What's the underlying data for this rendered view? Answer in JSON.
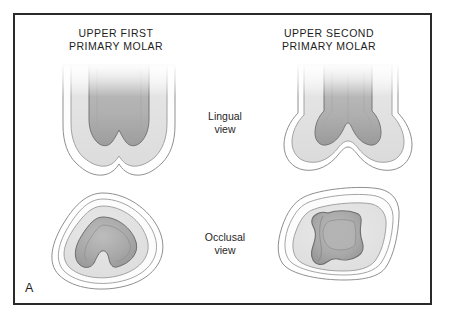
{
  "figure": {
    "panel_letter": "A",
    "border_color": "#2a2a2a",
    "background_color": "#ffffff"
  },
  "columns": [
    {
      "id": "upper-first",
      "title": "UPPER FIRST\nPRIMARY MOLAR"
    },
    {
      "id": "upper-second",
      "title": "UPPER SECOND\nPRIMARY MOLAR"
    }
  ],
  "rows": [
    {
      "id": "lingual",
      "label": "Lingual\nview"
    },
    {
      "id": "occlusal",
      "label": "Occlusal\nview"
    }
  ],
  "palette": {
    "enamel": "#ffffff",
    "enamel_outline": "#8f8f8f",
    "dentin": "#e3e3e3",
    "dentin_outline": "#9a9a9a",
    "pulp": "#b2b2b2",
    "pulp_outline": "#6e6e6e",
    "pulp_deep": "#9c9c9c",
    "text": "#1d1d1d"
  },
  "figures": [
    {
      "id": "first-lingual",
      "tooth": "upper first primary molar",
      "view": "lingual",
      "layers": [
        "enamel",
        "dentin",
        "pulp"
      ],
      "cusps": 2,
      "description": "narrow crown, tapering root trunk, two-lobed pulp chamber roof"
    },
    {
      "id": "second-lingual",
      "tooth": "upper second primary molar",
      "view": "lingual",
      "layers": [
        "enamel",
        "dentin",
        "pulp"
      ],
      "cusps": 2,
      "description": "broad rounded crown with deep central groove and prominent pulp horns"
    },
    {
      "id": "first-occlusal",
      "tooth": "upper first primary molar",
      "view": "occlusal",
      "layers": [
        "enamel",
        "dentin",
        "pulp"
      ],
      "outline_shape": "rounded triangular teardrop",
      "description": "concentric enamel, dentin and triangular pulp chamber"
    },
    {
      "id": "second-occlusal",
      "tooth": "upper second primary molar",
      "view": "occlusal",
      "layers": [
        "enamel",
        "dentin",
        "pulp"
      ],
      "outline_shape": "rounded rhomboid",
      "description": "four cusp outline with concave-sided pulp chamber"
    }
  ]
}
